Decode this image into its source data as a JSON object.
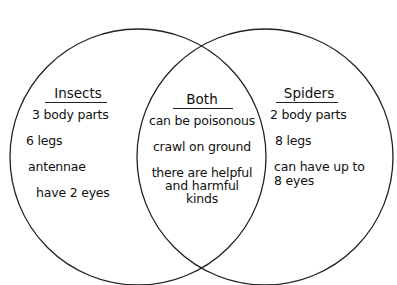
{
  "diagram": {
    "type": "venn",
    "left": {
      "title": "Insects",
      "items": [
        "3 body parts",
        "6 legs",
        "antennae",
        "have 2 eyes"
      ]
    },
    "overlap": {
      "title": "Both",
      "items": [
        "can be poisonous",
        "crawl on ground",
        "there are helpful",
        "and harmful",
        "kinds"
      ]
    },
    "right": {
      "title": "Spiders",
      "items": [
        "2 body parts",
        "8 legs",
        "can have up to",
        "8 eyes"
      ]
    },
    "colors": {
      "stroke": "#222222",
      "background": "#ffffff",
      "text": "#111111"
    }
  }
}
